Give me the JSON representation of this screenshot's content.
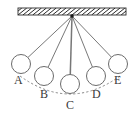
{
  "figure": {
    "background_color": "#ffffff",
    "stroke_color": "#4a4a4a",
    "label_color": "#3a3a3a",
    "width": 140,
    "height": 116
  },
  "ceiling": {
    "name": "hatched-ceiling-support",
    "x": 18,
    "y": 8,
    "width": 108,
    "height": 7,
    "hatch_count": 22,
    "hatch_color": "#2b2b2b"
  },
  "pivot": {
    "name": "pivot-point",
    "x": 72,
    "y": 16,
    "radius": 1.8,
    "color": "#1a1a1a"
  },
  "arc": {
    "name": "swing-path-arc",
    "style": "dashed",
    "start_x": 20,
    "start_y": 76,
    "end_x": 120,
    "end_y": 76,
    "control_x": 70,
    "control_y": 112
  },
  "bobs": [
    {
      "label": "A",
      "cx": 21,
      "cy": 64,
      "r": 9.5,
      "label_x": 14,
      "label_y": 84
    },
    {
      "label": "B",
      "cx": 44,
      "cy": 76,
      "r": 9.5,
      "label_x": 40,
      "label_y": 98
    },
    {
      "label": "C",
      "cx": 70,
      "cy": 84,
      "r": 9.5,
      "label_x": 66,
      "label_y": 109
    },
    {
      "label": "D",
      "cx": 96,
      "cy": 76,
      "r": 9.5,
      "label_x": 92,
      "label_y": 98
    },
    {
      "label": "E",
      "cx": 118,
      "cy": 64,
      "r": 9.5,
      "label_x": 114,
      "label_y": 84
    }
  ]
}
